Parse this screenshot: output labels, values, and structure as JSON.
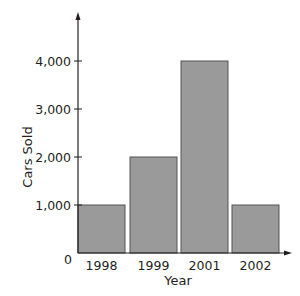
{
  "chart_data": {
    "type": "bar",
    "title": "",
    "xlabel": "Year",
    "ylabel": "Cars Sold",
    "categories": [
      "1998",
      "1999",
      "2001",
      "2002"
    ],
    "values": [
      1000,
      2000,
      4000,
      1000
    ],
    "ylim": [
      0,
      4000
    ],
    "yticks": [
      0,
      1000,
      2000,
      3000,
      4000
    ],
    "ytick_labels": [
      "0",
      "1,000",
      "2,000",
      "3,000",
      "4,000"
    ],
    "grid": false,
    "legend": null,
    "colors": {
      "bar_fill": "#9a9a9a",
      "bar_stroke": "#555555",
      "axis": "#231f20"
    }
  }
}
